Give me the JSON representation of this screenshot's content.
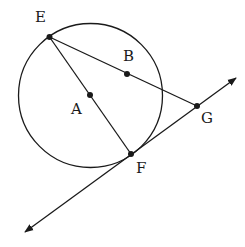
{
  "diagram": {
    "type": "geometry",
    "circle": {
      "center_label": "A",
      "cx": 90.5,
      "cy": 95.5,
      "r": 72
    },
    "points": [
      {
        "id": "E",
        "label": "E",
        "x": 49.5,
        "y": 37,
        "lx": 35,
        "ly": 22
      },
      {
        "id": "A",
        "label": "A",
        "x": 90,
        "y": 95,
        "lx": 71,
        "ly": 114
      },
      {
        "id": "B",
        "label": "B",
        "x": 127,
        "y": 74,
        "lx": 123,
        "ly": 61
      },
      {
        "id": "G",
        "label": "G",
        "x": 197,
        "y": 106,
        "lx": 201,
        "ly": 123
      },
      {
        "id": "F",
        "label": "F",
        "x": 131,
        "y": 154,
        "lx": 136,
        "ly": 173
      }
    ],
    "segments": [
      {
        "from": "E",
        "to": "F",
        "name": "diameter-EF"
      },
      {
        "from": "E",
        "to": "G",
        "name": "secant-EG"
      }
    ],
    "line": {
      "name": "tangent-line-FG",
      "through": [
        "F",
        "G"
      ],
      "x1": 25,
      "y1": 232,
      "x2": 236,
      "y2": 78
    },
    "colors": {
      "stroke": "#1a1a1a",
      "background": "#ffffff"
    }
  }
}
